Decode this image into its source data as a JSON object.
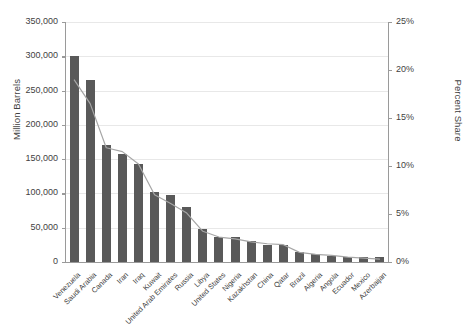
{
  "chart_data": {
    "type": "bar",
    "title": "",
    "xlabel": "",
    "ylabel": "Million Barrels",
    "y2label": "Percent Share",
    "ylim": [
      0,
      350000
    ],
    "y2lim": [
      0,
      25
    ],
    "grid": true,
    "legend": "none",
    "categories": [
      "Venezuela",
      "Saudi Arabia",
      "Canada",
      "Iran",
      "Iraq",
      "Kuwait",
      "United Arab Emirates",
      "Russia",
      "Libya",
      "United States",
      "Nigeria",
      "Kazakhstan",
      "China",
      "Qatar",
      "Brazil",
      "Algeria",
      "Angola",
      "Ecuador",
      "Mexico",
      "Azerbaijan"
    ],
    "ytick_labels": [
      "350,000",
      "300,000",
      "250,000",
      "200,000",
      "150,000",
      "100,000",
      "50,000",
      "0"
    ],
    "ytick_values": [
      350000,
      300000,
      250000,
      200000,
      150000,
      100000,
      50000,
      0
    ],
    "y2tick_labels": [
      "25%",
      "20%",
      "15%",
      "10%",
      "5%",
      "0%"
    ],
    "y2tick_values": [
      25,
      20,
      15,
      10,
      5,
      0
    ],
    "series": [
      {
        "name": "Million Barrels",
        "type": "bar",
        "color": "#595959",
        "values": [
          300000,
          266000,
          171000,
          158000,
          143000,
          102000,
          98000,
          80000,
          48000,
          37000,
          37000,
          30000,
          25000,
          25000,
          15000,
          12000,
          9000,
          8000,
          7000,
          7000
        ]
      },
      {
        "name": "Percent Share",
        "type": "line",
        "color": "#a6a6a6",
        "values": [
          19.0,
          16.5,
          11.9,
          11.5,
          10.2,
          7.0,
          6.1,
          5.1,
          3.2,
          2.6,
          2.4,
          2.1,
          1.9,
          1.8,
          1.0,
          0.8,
          0.7,
          0.5,
          0.4,
          0.3
        ]
      }
    ]
  }
}
